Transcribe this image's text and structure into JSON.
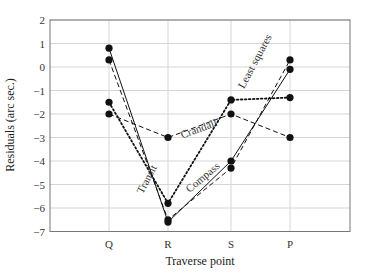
{
  "chart_data": {
    "type": "line",
    "title": "",
    "xlabel": "Traverse point",
    "ylabel": "Residuals (arc sec.)",
    "categories": [
      "Q",
      "R",
      "S",
      "P"
    ],
    "ylim": [
      -7,
      2
    ],
    "yticks": [
      2,
      1,
      0,
      -1,
      -2,
      -3,
      -4,
      -5,
      -6,
      -7
    ],
    "ytick_labels": [
      "2",
      "1",
      "0",
      "−1",
      "−2",
      "−3",
      "−4",
      "−5",
      "−6",
      "−7"
    ],
    "grid": true,
    "legend": "inline labels",
    "series": [
      {
        "name": "Least squares",
        "style": "solid",
        "values": [
          0.8,
          -6.6,
          -4.0,
          -0.1
        ]
      },
      {
        "name": "Compass",
        "style": "dashed",
        "values": [
          0.3,
          -6.5,
          -4.3,
          0.3
        ]
      },
      {
        "name": "Transit",
        "style": "dotted",
        "values": [
          -1.5,
          -5.8,
          -1.4,
          -1.3
        ]
      },
      {
        "name": "Crandall",
        "style": "dashed",
        "values": [
          -2.0,
          -3.0,
          -2.0,
          -3.0
        ]
      }
    ]
  }
}
